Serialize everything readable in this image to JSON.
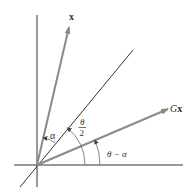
{
  "diagram": {
    "title": "",
    "colors": {
      "axis": "#333333",
      "vector": "#8a8a8a",
      "arc": "#666666",
      "text": "#333333"
    },
    "origin": [
      37,
      165
    ],
    "axes": {
      "horizontal": {
        "from": [
          14,
          165
        ],
        "to": [
          183,
          165
        ]
      },
      "vertical": {
        "from": [
          37,
          15
        ],
        "to": [
          37,
          187
        ]
      }
    },
    "bisector_line": {
      "from": [
        20,
        187
      ],
      "to": [
        133,
        50
      ]
    },
    "vectors": [
      {
        "id": "x",
        "label": "x",
        "tip": [
          69,
          27
        ],
        "label_pos": [
          71,
          19
        ]
      },
      {
        "id": "Gx",
        "label_prefix": "G",
        "label_vec": "x",
        "tip": [
          168,
          109
        ],
        "label_pos": [
          171,
          112
        ]
      }
    ],
    "angles": [
      {
        "id": "alpha",
        "label": "α",
        "label_pos": [
          50,
          139
        ]
      },
      {
        "id": "theta_half",
        "numerator": "θ",
        "denominator": "2",
        "label_pos": [
          82,
          129
        ]
      },
      {
        "id": "theta_minus_alpha",
        "label": "θ − α",
        "label_pos": [
          107,
          157
        ]
      }
    ]
  }
}
